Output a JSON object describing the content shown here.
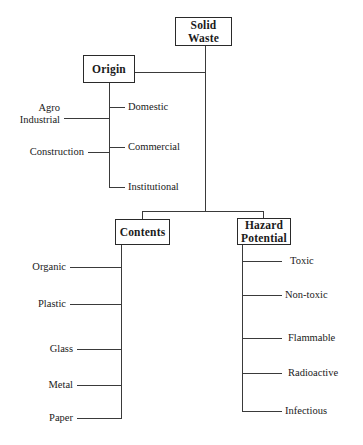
{
  "diagram": {
    "root": {
      "label": "Solid Waste"
    },
    "branches": [
      {
        "key": "origin",
        "label": "Origin",
        "left_children": [
          {
            "label": "Agro",
            "label_line2": "Industrial"
          },
          {
            "label": "Construction"
          }
        ],
        "right_children": [
          {
            "label": "Domestic"
          },
          {
            "label": "Commercial"
          },
          {
            "label": "Institutional"
          }
        ]
      },
      {
        "key": "contents",
        "label": "Contents",
        "left_children": [
          {
            "label": "Organic"
          },
          {
            "label": "Plastic"
          },
          {
            "label": "Glass"
          },
          {
            "label": "Metal"
          },
          {
            "label": "Paper"
          }
        ],
        "right_children": []
      },
      {
        "key": "hazard",
        "label": "Hazard Potential",
        "label_line1": "Hazard",
        "label_line2": "Potential",
        "left_children": [],
        "right_children": [
          {
            "label": "Toxic"
          },
          {
            "label": "Non-toxic"
          },
          {
            "label": "Flammable"
          },
          {
            "label": "Radioactive"
          },
          {
            "label": "Infectious"
          }
        ]
      }
    ],
    "colors": {
      "line": "#3a3a3a",
      "box_border": "#2a2a2a",
      "text": "#1a1a1a",
      "background": "#ffffff"
    }
  }
}
